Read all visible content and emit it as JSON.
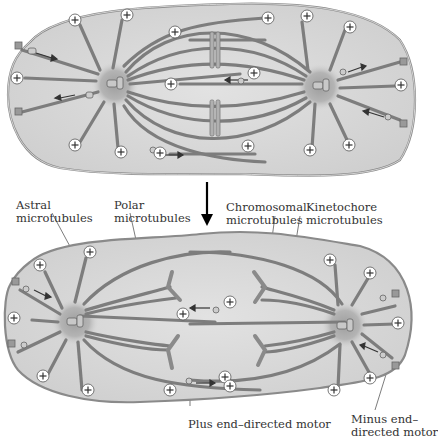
{
  "figure": {
    "panels": [
      {
        "id": "top",
        "stage": "prometaphase/metaphase spindle"
      },
      {
        "id": "bottom",
        "stage": "anaphase spindle (elongated)"
      }
    ],
    "transition_arrow": "down-arrow-icon"
  },
  "labels": {
    "astral": {
      "line1": "Astral",
      "line2": "microtubules"
    },
    "polar": {
      "line1": "Polar",
      "line2": "microtubules"
    },
    "chromosomal": {
      "line1": "Chromosomal",
      "line2": "microtubules"
    },
    "kinetochore": {
      "line1": "Kinetochore",
      "line2": "microtubules"
    },
    "plus_motor": {
      "line1": "Plus end–directed motor"
    },
    "minus_motor": {
      "line1": "Minus end–",
      "line2": "directed motor"
    }
  },
  "symbols": {
    "plus_end": "+"
  },
  "colors": {
    "cell_fill": "#d9d9d9",
    "cell_edge": "#8a8a8a",
    "microtubule": "#7d7d7d",
    "centrosome": "#a8a8a8",
    "text": "#333333"
  }
}
